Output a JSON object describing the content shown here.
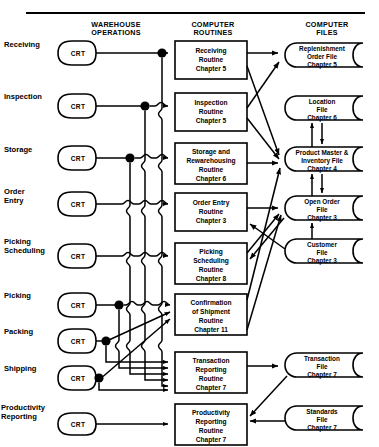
{
  "diagram": {
    "columns": [
      {
        "id": "warehouse",
        "line1": "WAREHOUSE",
        "line2": "OPERATIONS"
      },
      {
        "id": "routines",
        "line1": "COMPUTER",
        "line2": "ROUTINES"
      },
      {
        "id": "files",
        "line1": "COMPUTER",
        "line2": "FILES"
      }
    ],
    "terminal_label": "CRT",
    "rows": [
      {
        "id": "receiving",
        "label_line1": "Receiving",
        "label_line2": ""
      },
      {
        "id": "inspection",
        "label_line1": "Inspection",
        "label_line2": ""
      },
      {
        "id": "storage",
        "label_line1": "Storage",
        "label_line2": ""
      },
      {
        "id": "order-entry",
        "label_line1": "Order",
        "label_line2": "Entry"
      },
      {
        "id": "picking-sched",
        "label_line1": "Picking",
        "label_line2": "Scheduling"
      },
      {
        "id": "picking",
        "label_line1": "Picking",
        "label_line2": ""
      },
      {
        "id": "packing",
        "label_line1": "Packing",
        "label_line2": ""
      },
      {
        "id": "shipping",
        "label_line1": "Shipping",
        "label_line2": ""
      },
      {
        "id": "productivity",
        "label_line1": "Productivity",
        "label_line2": "Reporting"
      }
    ],
    "routines": [
      {
        "id": "receiving-routine",
        "lines": [
          "Receiving",
          "Routine",
          "Chapter 5"
        ]
      },
      {
        "id": "inspection-routine",
        "lines": [
          "Inspection",
          "Routine",
          "Chapter 5"
        ]
      },
      {
        "id": "storage-routine",
        "lines": [
          "Storage and",
          "Rewarehousing",
          "Routine",
          "Chapter 6"
        ]
      },
      {
        "id": "order-entry-routine",
        "lines": [
          "Order Entry",
          "Routine",
          "Chapter 3"
        ]
      },
      {
        "id": "picking-sched-routine",
        "lines": [
          "Picking",
          "Scheduling",
          "Routine",
          "Chapter 8"
        ]
      },
      {
        "id": "confirmation-routine",
        "lines": [
          "Confirmation",
          "of Shipment",
          "Routine",
          "Chapter 11"
        ]
      },
      {
        "id": "transaction-routine",
        "lines": [
          "Transaction",
          "Reporting",
          "Routine",
          "Chapter 7"
        ]
      },
      {
        "id": "productivity-routine",
        "lines": [
          "Productivity",
          "Reporting",
          "Routine",
          "Chapter 7"
        ]
      }
    ],
    "files": [
      {
        "id": "replenishment-order-file",
        "lines": [
          "Replenishment",
          "Order File",
          "Chapter 5"
        ]
      },
      {
        "id": "location-file",
        "lines": [
          "Location",
          "File",
          "Chapter 6"
        ]
      },
      {
        "id": "product-master-file",
        "lines": [
          "Product Master &",
          "Inventory File",
          "Chapter 4"
        ]
      },
      {
        "id": "open-order-file",
        "lines": [
          "Open Order",
          "File",
          "Chapter 3"
        ]
      },
      {
        "id": "customer-file",
        "lines": [
          "Customer",
          "File",
          "Chapter 3"
        ]
      },
      {
        "id": "transaction-file",
        "lines": [
          "Transaction",
          "File",
          "Chapter 7"
        ]
      },
      {
        "id": "standards-file",
        "lines": [
          "Standards",
          "File",
          "Chapter 7"
        ]
      }
    ],
    "colors": {
      "ink": "#000000",
      "paper": "#ffffff"
    }
  }
}
